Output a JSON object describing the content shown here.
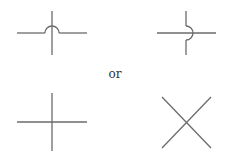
{
  "diagram": {
    "symbols": [
      {
        "name": "crossing-hop-horizontal",
        "description": "Horizontal wire hops over vertical wire (arc above)"
      },
      {
        "name": "crossing-hop-vertical",
        "description": "Vertical wire hops around horizontal wire (arc to the right)"
      },
      {
        "name": "crossing-plus",
        "description": "Plain plus-shaped crossing, no junction dot"
      },
      {
        "name": "crossing-x",
        "description": "Diagonal X-shaped crossing"
      }
    ],
    "separator_label": "or",
    "colors": {
      "line": "#6b6b6b",
      "text": "#333333",
      "background": "#ffffff"
    }
  }
}
